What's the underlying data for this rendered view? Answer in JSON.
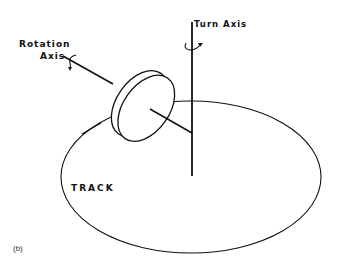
{
  "diagram": {
    "labels": {
      "rotation_axis_line1": "Rotation",
      "rotation_axis_line2": "Axis",
      "turn_axis": "Turn Axis",
      "track": "TRACK",
      "figure_tag": "(b)"
    },
    "elements": [
      {
        "id": "track",
        "type": "ellipse",
        "cx": 191,
        "cy": 177,
        "rx": 130,
        "ry": 76
      },
      {
        "id": "turn-axis",
        "type": "line",
        "x1": 192,
        "y1": 22,
        "x2": 192,
        "y2": 175
      },
      {
        "id": "rotation-axis",
        "type": "line",
        "x1": 65,
        "y1": 57,
        "x2": 192,
        "y2": 133
      },
      {
        "id": "wheel",
        "type": "disc",
        "cx": 145,
        "cy": 105,
        "tilt_deg": 35
      }
    ],
    "colors": {
      "line": "#111111",
      "background": "#ffffff"
    }
  }
}
